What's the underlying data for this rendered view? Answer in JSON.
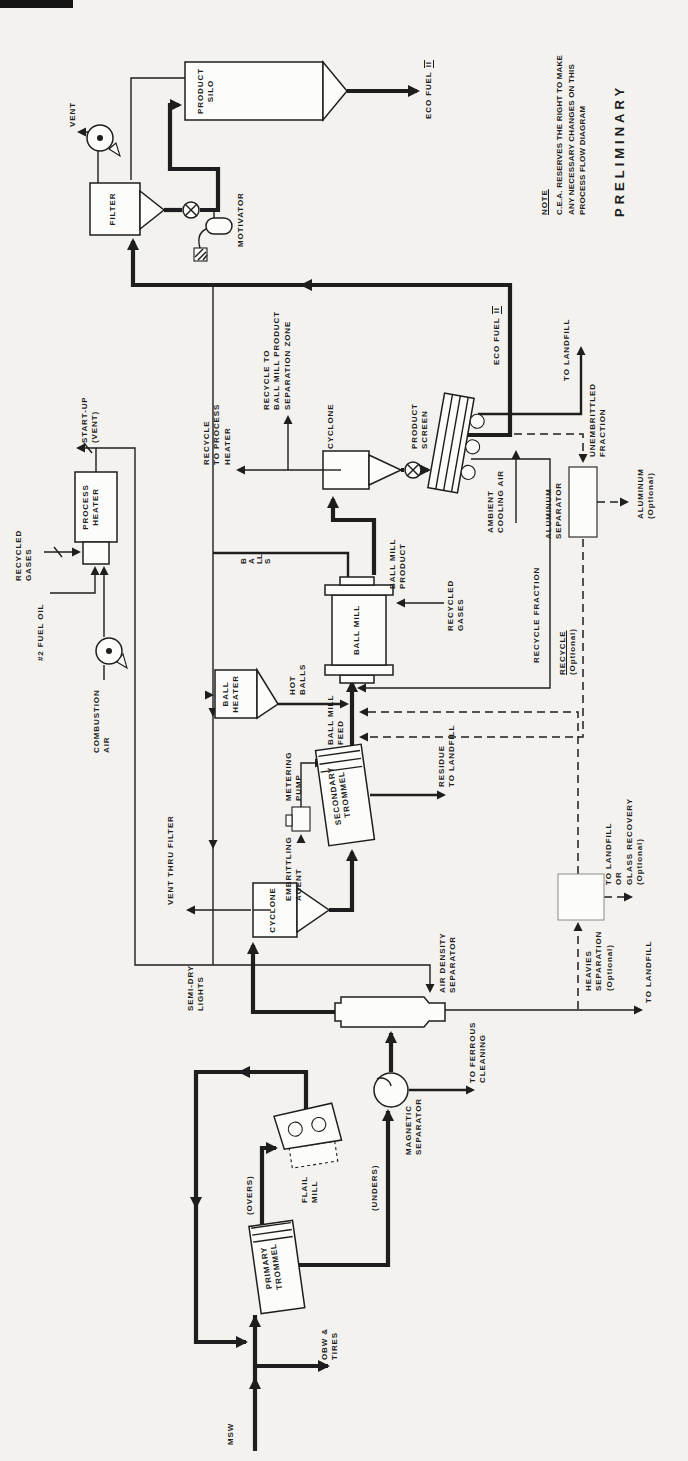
{
  "colors": {
    "paper": "#f3f2ee",
    "ink": "#1e1e1e"
  },
  "labels": {
    "msw": "MSW",
    "obw_tires": "OBW &\nTIRES",
    "primary_trommel": "PRIMARY\nTROMMEL",
    "overs": "(OVERS)",
    "flail_mill": "FLAIL\nMILL",
    "unders": "(UNDERS)",
    "magnetic_separator": "MAGNETIC\nSEPARATOR",
    "to_ferrous_cleaning": "TO FERROUS\nCLEANING",
    "air_density_separator": "AIR DENSITY\nSEPARATOR",
    "semi_dry_lights": "SEMI-DRY\nLIGHTS",
    "to_landfill_heavies": "TO LANDFILL",
    "cyclone_1": "CYCLONE",
    "vent_thru_filter": "VENT THRU FILTER",
    "embrittling_agent": "EMBRITTLING\nAGENT",
    "metering_pump": "METERING\nPUMP",
    "secondary_trommel": "SECONDARY\nTROMMEL",
    "residue_to_landfill": "RESIDUE\nTO LANDFILL",
    "ball_mill_feed": "BALL MILL\nFEED",
    "ball_heater": "BALL\nHEATER",
    "hot_balls": "HOT\nBALLS",
    "ball_mill": "BALL MILL",
    "balls": "BALLS",
    "recycled_gases_mill": "RECYCLED\nGASES",
    "ball_mill_product": "BALL MILL\nPRODUCT",
    "cyclone_2": "CYCLONE",
    "recycle_to_process_heater": "RECYCLE\nTO PROCESS\nHEATER",
    "recycle_to_separation_zone": "RECYCLE TO\nBALL MILL PRODUCT\nSEPARATION ZONE",
    "product_screen": "PRODUCT\nSCREEN",
    "ambient_cooling_air": "AMBIENT\nCOOLING AIR",
    "eco_fuel_prefix": "ECO FUEL",
    "eco_fuel_numeral": "II",
    "to_landfill_screen": "TO LANDFILL",
    "unembrittled_fraction": "UNEMBRITTLED\nFRACTION",
    "aluminum_separator": "ALUMINUM\nSEPARATOR",
    "aluminum_optional": "ALUMINUM\n(Optional)",
    "recycle_fraction": "RECYCLE FRACTION",
    "recycle_optional_word": "RECYCLE",
    "recycle_optional_paren": "(Optional)",
    "heavies_separation": "HEAVIES\nSEPARATION\n(Optional)",
    "to_landfill_or_glass": "TO LANDFILL\nOR\nGLASS RECOVERY\n(Optional)",
    "process_heater": "PROCESS\nHEATER",
    "startup_vent": "START-UP\n(VENT)",
    "recycled_gases_heater": "RECYCLED\nGASES",
    "fuel_oil": "#2 FUEL OIL",
    "combustion_air": "COMBUSTION\nAIR",
    "filter": "FILTER",
    "vent": "VENT",
    "motivator": "MOTIVATOR",
    "product_silo": "PRODUCT\nSILO",
    "note_title": "NOTE",
    "note_body": "C.E.A. RESERVES THE RIGHT TO MAKE\nANY NECESSARY CHANGES ON THIS\nPROCESS FLOW DIAGRAM",
    "preliminary": "PRELIMINARY"
  }
}
